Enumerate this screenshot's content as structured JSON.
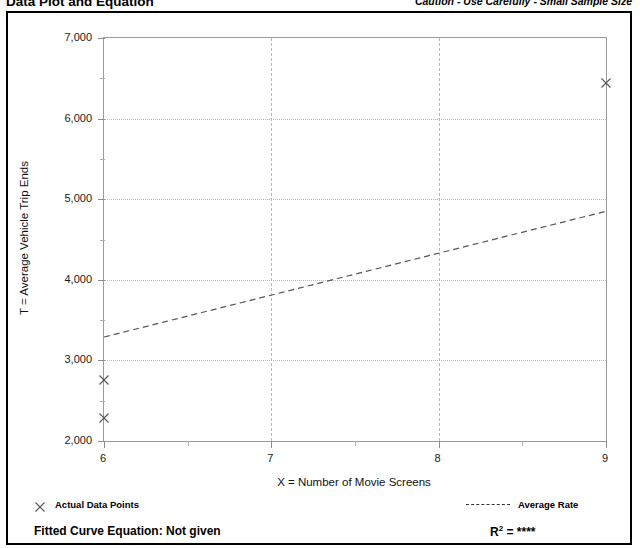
{
  "header": {
    "title": "Data Plot and Equation",
    "caution": "Caution - Use Carefully - Small Sample Size"
  },
  "legend": {
    "points_label": "Actual Data Points",
    "points_marker_icon": "x-marker-icon",
    "rate_label": "Average Rate",
    "rate_line_icon": "dashed-line-icon"
  },
  "footer": {
    "fitted_curve_equation": "Fitted Curve Equation:  Not given",
    "r2_prefix": "R",
    "r2_exponent": "2",
    "r2_value": " = ****"
  },
  "chart_data": {
    "type": "scatter",
    "title": "Data Plot and Equation",
    "xlabel": "X = Number of Movie Screens",
    "ylabel": "T = Average Vehicle Trip Ends",
    "xlim": [
      6,
      9
    ],
    "ylim": [
      2000,
      7000
    ],
    "xticks": [
      6,
      7,
      8,
      9
    ],
    "xtick_labels": [
      "6",
      "7",
      "8",
      "9"
    ],
    "xminor_ticks": [
      6.5,
      7.5,
      8.5
    ],
    "yticks": [
      2000,
      3000,
      4000,
      5000,
      6000,
      7000
    ],
    "ytick_labels": [
      "2,000",
      "3,000",
      "4,000",
      "5,000",
      "6,000",
      "7,000"
    ],
    "yminor_ticks": [
      2500,
      3500,
      4500,
      5500,
      6500
    ],
    "grid": true,
    "legend_position": "below-axes",
    "series": [
      {
        "name": "Actual Data Points",
        "type": "scatter",
        "marker": "x",
        "color": "#555555",
        "points": [
          {
            "x": 6,
            "y": 2280
          },
          {
            "x": 6,
            "y": 2760
          },
          {
            "x": 9,
            "y": 6440
          }
        ]
      },
      {
        "name": "Average Rate",
        "type": "line",
        "style": "dashed",
        "color": "#555555",
        "x": [
          6,
          9
        ],
        "y": [
          3290,
          4850
        ]
      }
    ]
  }
}
